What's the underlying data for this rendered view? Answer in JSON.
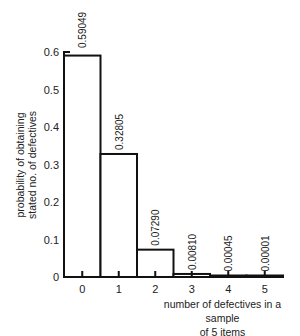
{
  "chart_data": {
    "type": "bar",
    "title": "",
    "xlabel": "number of defectives in a sample of 5 items",
    "xlabel_lines": [
      "number of defectives in a sample",
      "of 5 items"
    ],
    "ylabel": "probability of obtaining stated no. of defectives",
    "ylabel_lines": [
      "probability of obtaining",
      "stated no. of defectives"
    ],
    "categories": [
      "0",
      "1",
      "2",
      "3",
      "4",
      "5"
    ],
    "values": [
      0.59049,
      0.32805,
      0.0729,
      0.0081,
      0.00045,
      1e-05
    ],
    "data_labels": [
      "0.59049",
      "0.32805",
      "0.07290",
      "0.00810",
      "0.00045",
      "0.00001"
    ],
    "yticks": [
      0,
      0.1,
      0.2,
      0.3,
      0.4,
      0.5,
      0.6
    ],
    "ytick_labels": [
      "0",
      "0.1",
      "0.2",
      "0.3",
      "0.4",
      "0.5",
      "0.6"
    ],
    "ylim": [
      0,
      0.6
    ],
    "grid": false,
    "legend": null,
    "bar_style": "histogram, adjacent bars, black outline, white fill"
  }
}
